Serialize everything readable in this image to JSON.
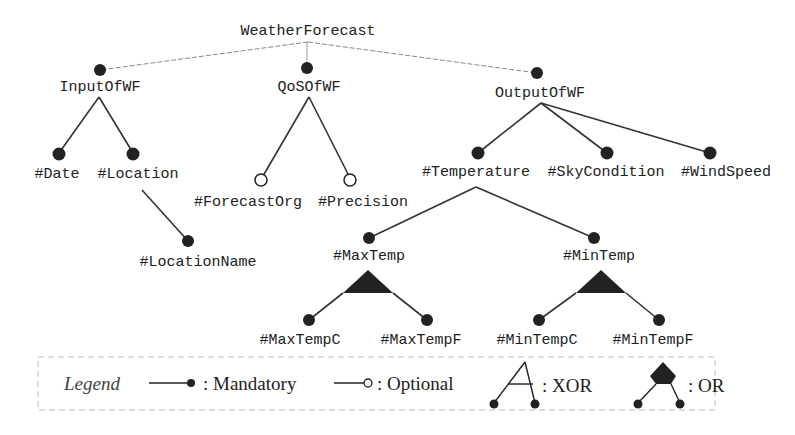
{
  "diagram": {
    "type": "feature-model-tree",
    "root": {
      "id": "root",
      "label": "WeatherForecast"
    },
    "nodes": [
      {
        "id": "input",
        "label": "InputOfWF",
        "parent": "root",
        "kind": "mandatory"
      },
      {
        "id": "qos",
        "label": "QoSOfWF",
        "parent": "root",
        "kind": "mandatory"
      },
      {
        "id": "output",
        "label": "OutputOfWF",
        "parent": "root",
        "kind": "mandatory"
      },
      {
        "id": "date",
        "label": "#Date",
        "parent": "input",
        "kind": "mandatory"
      },
      {
        "id": "location",
        "label": "#Location",
        "parent": "input",
        "kind": "mandatory"
      },
      {
        "id": "locname",
        "label": "#LocationName",
        "parent": "location",
        "kind": "mandatory"
      },
      {
        "id": "forecastorg",
        "label": "#ForecastOrg",
        "parent": "qos",
        "kind": "optional"
      },
      {
        "id": "precision",
        "label": "#Precision",
        "parent": "qos",
        "kind": "optional"
      },
      {
        "id": "temperature",
        "label": "#Temperature",
        "parent": "output",
        "kind": "mandatory"
      },
      {
        "id": "skycondition",
        "label": "#SkyCondition",
        "parent": "output",
        "kind": "mandatory"
      },
      {
        "id": "windspeed",
        "label": "#WindSpeed",
        "parent": "output",
        "kind": "mandatory"
      },
      {
        "id": "maxtemp",
        "label": "#MaxTemp",
        "parent": "temperature",
        "kind": "mandatory"
      },
      {
        "id": "mintemp",
        "label": "#MinTemp",
        "parent": "temperature",
        "kind": "mandatory"
      },
      {
        "id": "maxtempc",
        "label": "#MaxTempC",
        "parent": "maxtemp",
        "kind": "or-group"
      },
      {
        "id": "maxtempf",
        "label": "#MaxTempF",
        "parent": "maxtemp",
        "kind": "or-group"
      },
      {
        "id": "mintempc",
        "label": "#MinTempC",
        "parent": "mintemp",
        "kind": "or-group"
      },
      {
        "id": "mintempf",
        "label": "#MinTempF",
        "parent": "mintemp",
        "kind": "or-group"
      }
    ],
    "legend": {
      "title": "Legend",
      "mandatory": ": Mandatory",
      "optional": ": Optional",
      "xor": ": XOR",
      "or": ": OR"
    },
    "colors": {
      "line": "#333333",
      "dot": "#222222",
      "root_edge": "#888888",
      "legend_border": "#bbbbbb"
    }
  }
}
